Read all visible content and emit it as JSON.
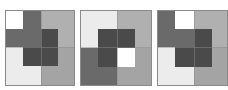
{
  "figure": {
    "colors": {
      "white": "#ffffff",
      "lightest": "#ececec",
      "light_gray": "#b0b0b0",
      "medium_gray": "#a4a4a4",
      "dark_gray": "#6a6a6a",
      "darkest": "#4a4a4a",
      "border": "#8a8a8a"
    },
    "panels": [
      {
        "id": "panel-1",
        "left": 5,
        "width": 70,
        "rects": [
          {
            "name": "bottom-left-light",
            "x": 0,
            "y": 36,
            "w": 35,
            "h": 40,
            "color": "#ececec"
          },
          {
            "name": "bottom-right-medium",
            "x": 35,
            "y": 36,
            "w": 35,
            "h": 40,
            "color": "#a4a4a4"
          },
          {
            "name": "top-right-light-gray",
            "x": 35,
            "y": 0,
            "w": 35,
            "h": 36,
            "color": "#b0b0b0"
          },
          {
            "name": "center-darkest",
            "x": 17,
            "y": 18,
            "w": 35,
            "h": 37,
            "color": "#4a4a4a"
          },
          {
            "name": "top-center-dark-gray",
            "x": 17,
            "y": 0,
            "w": 18,
            "h": 36,
            "color": "#6a6a6a"
          },
          {
            "name": "band-dark-gray",
            "x": 0,
            "y": 18,
            "w": 35,
            "h": 18,
            "color": "#6a6a6a"
          },
          {
            "name": "top-left-white",
            "x": 0,
            "y": 0,
            "w": 17,
            "h": 18,
            "color": "#ffffff"
          }
        ]
      },
      {
        "id": "panel-2",
        "left": 80,
        "width": 72,
        "rects": [
          {
            "name": "top-left-light",
            "x": 0,
            "y": 0,
            "w": 36,
            "h": 37,
            "color": "#ececec"
          },
          {
            "name": "top-right-light-gray",
            "x": 36,
            "y": 0,
            "w": 36,
            "h": 37,
            "color": "#b0b0b0"
          },
          {
            "name": "bottom-left-dark-gray",
            "x": 0,
            "y": 37,
            "w": 36,
            "h": 39,
            "color": "#6a6a6a"
          },
          {
            "name": "bottom-right-medium",
            "x": 36,
            "y": 37,
            "w": 36,
            "h": 39,
            "color": "#a4a4a4"
          },
          {
            "name": "center-darkest",
            "x": 17,
            "y": 18,
            "w": 37,
            "h": 38,
            "color": "#4a4a4a"
          },
          {
            "name": "center-white",
            "x": 36,
            "y": 37,
            "w": 18,
            "h": 19,
            "color": "#ffffff"
          }
        ]
      },
      {
        "id": "panel-3",
        "left": 157,
        "width": 71,
        "rects": [
          {
            "name": "bottom-left-light",
            "x": 0,
            "y": 36,
            "w": 36,
            "h": 40,
            "color": "#ececec"
          },
          {
            "name": "bottom-right-medium",
            "x": 36,
            "y": 36,
            "w": 35,
            "h": 40,
            "color": "#a4a4a4"
          },
          {
            "name": "top-right-light-gray",
            "x": 36,
            "y": 0,
            "w": 35,
            "h": 36,
            "color": "#b0b0b0"
          },
          {
            "name": "center-darkest",
            "x": 17,
            "y": 18,
            "w": 37,
            "h": 38,
            "color": "#4a4a4a"
          },
          {
            "name": "left-column-dark-gray",
            "x": 0,
            "y": 0,
            "w": 17,
            "h": 36,
            "color": "#6a6a6a"
          },
          {
            "name": "band-dark-gray",
            "x": 0,
            "y": 18,
            "w": 36,
            "h": 18,
            "color": "#6a6a6a"
          },
          {
            "name": "top-center-white",
            "x": 17,
            "y": 0,
            "w": 19,
            "h": 18,
            "color": "#ffffff"
          }
        ]
      }
    ]
  }
}
